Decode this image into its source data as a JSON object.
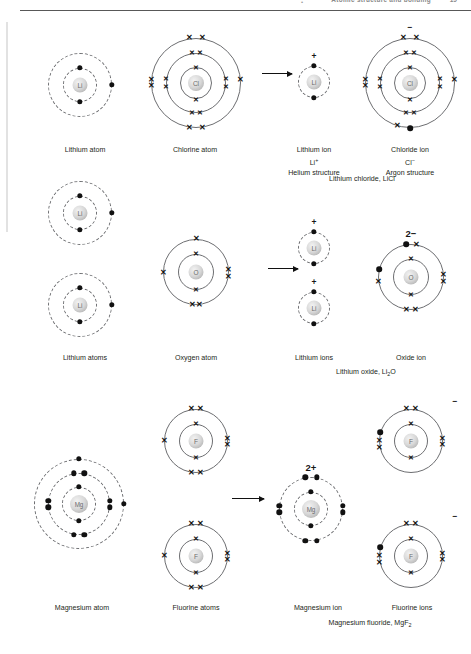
{
  "page": {
    "running_head": "Atomic structure and bonding",
    "bullet": "•",
    "folio": "19"
  },
  "reactions": [
    {
      "id": "lithium-chloride",
      "product_caption": "Lithium chloride, LiCl",
      "species": [
        {
          "id": "lithium-atom",
          "label": "Lithium atom",
          "symbol": "Li",
          "sublabels": [],
          "charge": "",
          "shell_style": "dashed",
          "shells": [
            {
              "electrons": 2,
              "marks": "dot"
            },
            {
              "electrons": 1,
              "marks": "dot"
            }
          ]
        },
        {
          "id": "chlorine-atom",
          "label": "Chlorine atom",
          "symbol": "Cl",
          "sublabels": [],
          "charge": "",
          "shell_style": "solid",
          "shells": [
            {
              "electrons": 2,
              "marks": "cross"
            },
            {
              "electrons": 8,
              "marks": "cross"
            },
            {
              "electrons": 7,
              "marks": "cross"
            }
          ]
        },
        {
          "id": "lithium-ion",
          "label": "Lithium ion",
          "symbol": "Li",
          "sublabels": [
            "Li⁺",
            "Helium structure"
          ],
          "charge": "+",
          "shell_style": "dashed",
          "shells": [
            {
              "electrons": 2,
              "marks": "dot"
            }
          ]
        },
        {
          "id": "chloride-ion",
          "label": "Chloride ion",
          "symbol": "Cl",
          "sublabels": [
            "Cl⁻",
            "Argon structure"
          ],
          "charge": "−",
          "shell_style": "solid",
          "shells": [
            {
              "electrons": 2,
              "marks": "cross"
            },
            {
              "electrons": 8,
              "marks": "cross"
            },
            {
              "electrons": 8,
              "marks": "cross+dot"
            }
          ]
        }
      ]
    },
    {
      "id": "lithium-oxide",
      "product_caption": "Lithium oxide, Li₂O",
      "species": [
        {
          "id": "lithium-atoms",
          "label": "Lithium atoms",
          "symbol": "Li",
          "sublabels": [],
          "charge": "",
          "shell_style": "dashed",
          "count": 2,
          "shells": [
            {
              "electrons": 2,
              "marks": "dot"
            },
            {
              "electrons": 1,
              "marks": "dot"
            }
          ]
        },
        {
          "id": "oxygen-atom",
          "label": "Oxygen atom",
          "symbol": "O",
          "sublabels": [],
          "charge": "",
          "shell_style": "solid",
          "shells": [
            {
              "electrons": 2,
              "marks": "cross"
            },
            {
              "electrons": 6,
              "marks": "cross"
            }
          ]
        },
        {
          "id": "lithium-ions",
          "label": "Lithium ions",
          "symbol": "Li",
          "sublabels": [],
          "charge": "+",
          "shell_style": "dashed",
          "count": 2,
          "shells": [
            {
              "electrons": 2,
              "marks": "dot"
            }
          ]
        },
        {
          "id": "oxide-ion",
          "label": "Oxide ion",
          "symbol": "O",
          "sublabels": [],
          "charge": "2−",
          "shell_style": "solid",
          "shells": [
            {
              "electrons": 2,
              "marks": "cross"
            },
            {
              "electrons": 8,
              "marks": "cross+2dot"
            }
          ]
        }
      ]
    },
    {
      "id": "magnesium-fluoride",
      "product_caption": "Magnesium fluoride, MgF₂",
      "species": [
        {
          "id": "magnesium-atom",
          "label": "Magnesium atom",
          "symbol": "Mg",
          "sublabels": [],
          "charge": "",
          "shell_style": "dashed",
          "shells": [
            {
              "electrons": 2,
              "marks": "dot"
            },
            {
              "electrons": 8,
              "marks": "dot"
            },
            {
              "electrons": 2,
              "marks": "dot"
            }
          ]
        },
        {
          "id": "fluorine-atoms",
          "label": "Fluorine atoms",
          "symbol": "F",
          "sublabels": [],
          "charge": "",
          "shell_style": "solid",
          "count": 2,
          "shells": [
            {
              "electrons": 2,
              "marks": "cross"
            },
            {
              "electrons": 7,
              "marks": "cross"
            }
          ]
        },
        {
          "id": "magnesium-ion",
          "label": "Magnesium ion",
          "symbol": "Mg",
          "sublabels": [],
          "charge": "2+",
          "shell_style": "dashed",
          "shells": [
            {
              "electrons": 2,
              "marks": "dot"
            },
            {
              "electrons": 8,
              "marks": "dot"
            }
          ]
        },
        {
          "id": "fluoride-ions",
          "label": "Fluorine ions",
          "symbol": "F",
          "sublabels": [],
          "charge": "−",
          "shell_style": "solid",
          "count": 2,
          "shells": [
            {
              "electrons": 2,
              "marks": "cross"
            },
            {
              "electrons": 8,
              "marks": "cross+dot"
            }
          ]
        }
      ]
    }
  ],
  "captions": {
    "lithium_atom": "Lithium atom",
    "chlorine_atom": "Chlorine atom",
    "lithium_ion": "Lithium ion",
    "lithium_ion_formula": "Li+",
    "lithium_ion_structure": "Helium structure",
    "chloride_ion": "Chloride ion",
    "chloride_ion_formula": "Cl−",
    "chloride_ion_structure": "Argon structure",
    "lithium_chloride": "Lithium chloride, LiCl",
    "lithium_atoms": "Lithium atoms",
    "oxygen_atom": "Oxygen atom",
    "lithium_ions": "Lithium ions",
    "oxide_ion": "Oxide ion",
    "lithium_oxide_pre": "Lithium oxide, Li",
    "lithium_oxide_sub": "2",
    "lithium_oxide_post": "O",
    "magnesium_atom": "Magnesium atom",
    "fluorine_atoms": "Fluorine atoms",
    "magnesium_ion": "Magnesium ion",
    "fluorine_ions": "Fluorine ions",
    "magnesium_fluoride_pre": "Magnesium fluoride, MgF",
    "magnesium_fluoride_sub": "2"
  },
  "charges": {
    "minus": "−",
    "plus": "+",
    "two_minus": "2−",
    "two_plus": "2+"
  },
  "symbols": {
    "li": "Li",
    "cl": "Cl",
    "o": "O",
    "mg": "Mg",
    "f": "F"
  },
  "colors": {
    "shell": "#6d6e71",
    "electron": "#111111",
    "text": "#231f20",
    "rule": "#585858",
    "nucleus": "#d8d8d8"
  }
}
